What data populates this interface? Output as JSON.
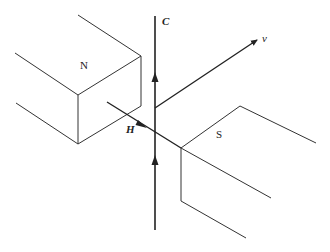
{
  "diagram": {
    "labels": {
      "north_pole": "N",
      "south_pole": "S",
      "conductor": "C",
      "field": "H",
      "velocity": "v"
    },
    "stroke_color": "#333333"
  }
}
